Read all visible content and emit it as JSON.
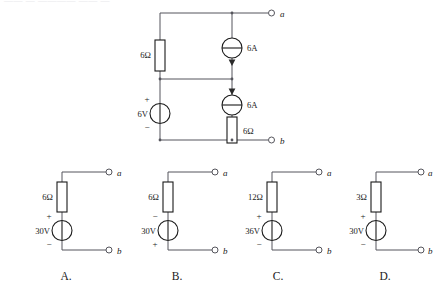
{
  "page": {
    "background_color": "#ffffff",
    "ink_color": "#1a1a1a",
    "wire_color": "#55555c",
    "cut_off_header_text": "—— — ———— —— —"
  },
  "main_circuit": {
    "name": "source-network-with-terminals-a-b",
    "terminals": [
      {
        "id": "a",
        "label": "a"
      },
      {
        "id": "b",
        "label": "b"
      }
    ],
    "components": [
      {
        "id": "r-left",
        "kind": "resistor",
        "label": "6Ω",
        "orientation": "vertical"
      },
      {
        "id": "i-top",
        "kind": "current-source",
        "label": "6A",
        "arrow_direction": "down",
        "arrow_position": "below"
      },
      {
        "id": "i-bottom",
        "kind": "current-source",
        "label": "6A",
        "arrow_direction": "down",
        "arrow_position": "above"
      },
      {
        "id": "r-bottom",
        "kind": "resistor",
        "label": "6Ω",
        "orientation": "vertical"
      },
      {
        "id": "v-source",
        "kind": "voltage-source",
        "label": "6V",
        "plus": "+",
        "minus": "−"
      }
    ]
  },
  "choices": [
    {
      "key": "A",
      "caption": "A.",
      "resistor_label": "6Ω",
      "source_label": "30V",
      "top_sign": "+",
      "bottom_sign": "−",
      "terminal_a": "a",
      "terminal_b": "b"
    },
    {
      "key": "B",
      "caption": "B.",
      "resistor_label": "6Ω",
      "source_label": "30V",
      "top_sign": "−",
      "bottom_sign": "+",
      "terminal_a": "a",
      "terminal_b": "b"
    },
    {
      "key": "C",
      "caption": "C.",
      "resistor_label": "12Ω",
      "source_label": "36V",
      "top_sign": "+",
      "bottom_sign": "−",
      "terminal_a": "a",
      "terminal_b": "b"
    },
    {
      "key": "D",
      "caption": "D.",
      "resistor_label": "3Ω",
      "source_label": "30V",
      "top_sign": "+",
      "bottom_sign": "−",
      "terminal_a": "a",
      "terminal_b": "b"
    }
  ]
}
